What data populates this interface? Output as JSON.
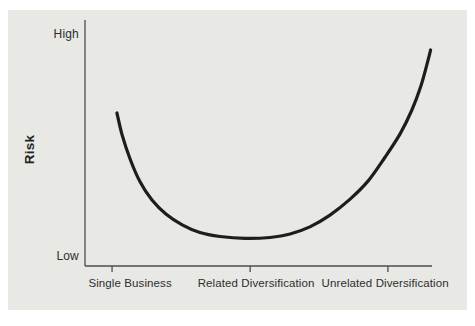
{
  "figure": {
    "background_color": "#ffffff",
    "panel_color": "#e8e8e5",
    "axis_color": "#4d4d4b",
    "curve_color": "#1d1d1d",
    "text_color": "#2e2e2c"
  },
  "chart_data": {
    "type": "line",
    "title": "",
    "xlabel": "",
    "ylabel": "Risk",
    "y_axis_labels": {
      "top": "High",
      "bottom": "Low"
    },
    "y_axis_scale": "qualitative (Low to High)",
    "ylim": [
      0,
      100
    ],
    "xlim": [
      0,
      100
    ],
    "grid": false,
    "legend": "none",
    "categories": [
      "Single Business",
      "Related Diversification",
      "Unrelated Diversification"
    ],
    "category_tick_x_pct": [
      7.8,
      47.6,
      87.3
    ],
    "category_label_x_pct": [
      13.0,
      49.3,
      86.5
    ],
    "series": [
      {
        "name": "risk-vs-diversification-curve",
        "shape": "U-shaped curve",
        "points_pct": [
          [
            9.2,
            62.2
          ],
          [
            10.7,
            53.3
          ],
          [
            13.0,
            43.5
          ],
          [
            15.9,
            34.1
          ],
          [
            19.3,
            26.8
          ],
          [
            23.3,
            21.1
          ],
          [
            28.0,
            16.7
          ],
          [
            33.1,
            13.6
          ],
          [
            38.9,
            12.0
          ],
          [
            46.1,
            11.2
          ],
          [
            53.3,
            11.6
          ],
          [
            59.1,
            13.0
          ],
          [
            64.8,
            15.9
          ],
          [
            70.6,
            20.7
          ],
          [
            76.4,
            27.2
          ],
          [
            81.6,
            34.6
          ],
          [
            86.5,
            44.3
          ],
          [
            90.8,
            53.7
          ],
          [
            94.2,
            63.4
          ],
          [
            96.8,
            73.2
          ],
          [
            98.8,
            83.3
          ],
          [
            99.6,
            87.8
          ]
        ]
      }
    ]
  }
}
